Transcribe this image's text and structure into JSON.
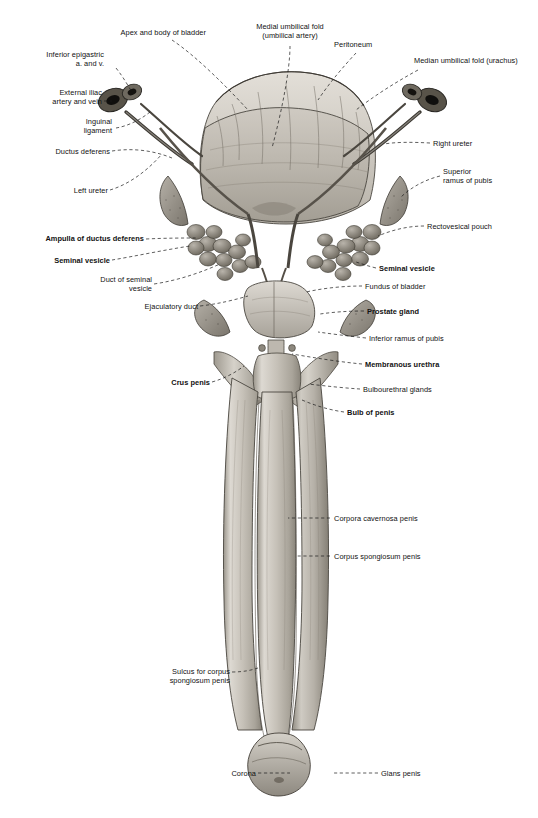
{
  "figure": {
    "caption": "",
    "type": "anatomical-illustration",
    "view": "anterior"
  },
  "labels": {
    "left": [
      {
        "id": "inferior-epigastric",
        "text": "Inferior epigastric\na. and v.",
        "bold": false
      },
      {
        "id": "external-iliac",
        "text": "External iliac\nartery and vein",
        "bold": false
      },
      {
        "id": "inguinal-ligament",
        "text": "Inguinal\nligament",
        "bold": false
      },
      {
        "id": "ductus-deferens",
        "text": "Ductus deferens",
        "bold": false
      },
      {
        "id": "left-ureter",
        "text": "Left ureter",
        "bold": false
      },
      {
        "id": "ampulla-ductus-deferens",
        "text": "Ampulla of ductus deferens",
        "bold": true
      },
      {
        "id": "seminal-vesicle-left",
        "text": "Seminal vesicle",
        "bold": true
      },
      {
        "id": "duct-seminal-vesicle",
        "text": "Duct of seminal\nvesicle",
        "bold": false
      },
      {
        "id": "ejaculatory-duct",
        "text": "Ejaculatory duct",
        "bold": false
      },
      {
        "id": "crus-penis",
        "text": "Crus penis",
        "bold": true
      },
      {
        "id": "sulcus-corpus-spongiosum",
        "text": "Sulcus for corpus\nspongiosum penis",
        "bold": false
      },
      {
        "id": "corona",
        "text": "Corona",
        "bold": false
      }
    ],
    "top": [
      {
        "id": "apex-body-bladder",
        "text": "Apex and body of bladder",
        "bold": false
      },
      {
        "id": "medial-umbilical-fold",
        "text": "Medial umbilical fold\n(umbilical artery)",
        "bold": false
      },
      {
        "id": "peritoneum",
        "text": "Peritoneum",
        "bold": false
      },
      {
        "id": "median-umbilical-fold",
        "text": "Median umbilical fold (urachus)",
        "bold": false
      }
    ],
    "right": [
      {
        "id": "right-ureter",
        "text": "Right ureter",
        "bold": false
      },
      {
        "id": "superior-ramus-pubis",
        "text": "Superior\nramus of pubis",
        "bold": false
      },
      {
        "id": "rectovesical-pouch",
        "text": "Rectovesical pouch",
        "bold": false
      },
      {
        "id": "seminal-vesicle-right",
        "text": "Seminal vesicle",
        "bold": true
      },
      {
        "id": "fundus-bladder",
        "text": "Fundus of bladder",
        "bold": false
      },
      {
        "id": "prostate-gland",
        "text": "Prostate gland",
        "bold": true
      },
      {
        "id": "inferior-ramus-pubis",
        "text": "Inferior ramus of pubis",
        "bold": false
      },
      {
        "id": "membranous-urethra",
        "text": "Membranous urethra",
        "bold": true
      },
      {
        "id": "bulbourethral-glands",
        "text": "Bulbourethral glands",
        "bold": false
      },
      {
        "id": "bulb-penis",
        "text": "Bulb of penis",
        "bold": true
      },
      {
        "id": "corpora-cavernosa",
        "text": "Corpora cavernosa penis",
        "bold": false
      },
      {
        "id": "corpus-spongiosum",
        "text": "Corpus spongiosum penis",
        "bold": false
      },
      {
        "id": "glans-penis",
        "text": "Glans penis",
        "bold": false
      }
    ]
  },
  "colors": {
    "ink": "#111111",
    "leader": "#1a1a1a",
    "tissue_light": "#d8d4cd",
    "tissue_mid": "#b4afa6",
    "tissue_dark": "#8d887e",
    "tissue_deep": "#6b665d",
    "vessel_dark": "#2a2824",
    "background": "#ffffff"
  }
}
